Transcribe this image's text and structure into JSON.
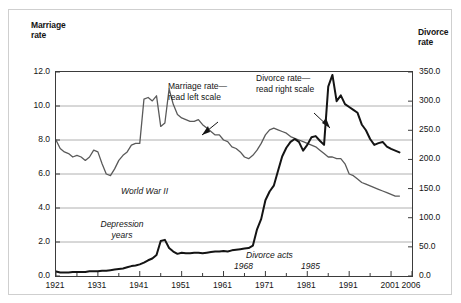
{
  "chart_data": {
    "type": "line",
    "title": "",
    "subtitle": "",
    "xlabel": "",
    "ylabel": "Marriage rate",
    "y2label": "Divorce rate",
    "grid": true,
    "legend_position": "inline-annotations",
    "xlim": [
      1921,
      2006
    ],
    "ylim": [
      0.0,
      12.0
    ],
    "y2lim": [
      0.0,
      350.0
    ],
    "x_ticks": [
      "1921",
      "1931",
      "1941",
      "1951",
      "1961",
      "1971",
      "1981",
      "1991",
      "2001",
      "2006"
    ],
    "x_tick_values": [
      1921,
      1931,
      1941,
      1951,
      1961,
      1971,
      1981,
      1991,
      2001,
      2006
    ],
    "y_ticks_left": [
      "0.0",
      "2.0",
      "4.0",
      "6.0",
      "8.0",
      "10.0",
      "12.0"
    ],
    "y_tick_values_left": [
      0.0,
      2.0,
      4.0,
      6.0,
      8.0,
      10.0,
      12.0
    ],
    "y_ticks_right": [
      "0.0",
      "50.0",
      "100.0",
      "150.0",
      "200.0",
      "250.0",
      "300.0",
      "350.0"
    ],
    "y_tick_values_right": [
      0.0,
      50.0,
      100.0,
      150.0,
      200.0,
      250.0,
      300.0,
      350.0
    ],
    "series": [
      {
        "name": "Marriage rate",
        "axis": "left",
        "color": "#5a5a5a",
        "x": [
          1921,
          1922,
          1923,
          1924,
          1925,
          1926,
          1927,
          1928,
          1929,
          1930,
          1931,
          1932,
          1933,
          1934,
          1935,
          1936,
          1937,
          1938,
          1939,
          1940,
          1941,
          1942,
          1943,
          1944,
          1945,
          1946,
          1947,
          1948,
          1949,
          1950,
          1951,
          1952,
          1953,
          1954,
          1955,
          1956,
          1957,
          1958,
          1959,
          1960,
          1961,
          1962,
          1963,
          1964,
          1965,
          1966,
          1967,
          1968,
          1969,
          1970,
          1971,
          1972,
          1973,
          1974,
          1975,
          1976,
          1977,
          1978,
          1979,
          1980,
          1981,
          1982,
          1983,
          1984,
          1985,
          1986,
          1987,
          1988,
          1989,
          1990,
          1991,
          1992,
          1993,
          1994,
          1995,
          1996,
          1997,
          1998,
          1999,
          2000,
          2001,
          2002,
          2003
        ],
        "values": [
          8.0,
          7.5,
          7.3,
          7.2,
          7.0,
          7.1,
          7.0,
          6.8,
          7.0,
          7.4,
          7.3,
          6.6,
          6.0,
          5.9,
          6.3,
          6.8,
          7.1,
          7.3,
          7.7,
          7.8,
          7.8,
          10.4,
          10.5,
          10.3,
          10.6,
          8.8,
          9.0,
          11.0,
          10.1,
          9.5,
          9.3,
          9.2,
          9.1,
          9.1,
          9.2,
          8.9,
          8.7,
          8.5,
          8.3,
          8.3,
          8.0,
          7.9,
          7.6,
          7.5,
          7.3,
          7.0,
          6.9,
          7.1,
          7.4,
          7.8,
          8.3,
          8.6,
          8.7,
          8.6,
          8.5,
          8.4,
          8.2,
          8.1,
          8.0,
          7.9,
          7.8,
          7.7,
          7.6,
          7.4,
          7.2,
          7.0,
          7.0,
          6.9,
          6.9,
          6.6,
          6.0,
          5.9,
          5.7,
          5.5,
          5.4,
          5.3,
          5.2,
          5.1,
          5.0,
          4.9,
          4.8,
          4.7,
          4.7
        ]
      },
      {
        "name": "Divorce rate",
        "axis": "right",
        "color": "#141414",
        "x": [
          1921,
          1922,
          1923,
          1924,
          1925,
          1926,
          1927,
          1928,
          1929,
          1930,
          1931,
          1932,
          1933,
          1934,
          1935,
          1936,
          1937,
          1938,
          1939,
          1940,
          1941,
          1942,
          1943,
          1944,
          1945,
          1946,
          1947,
          1948,
          1949,
          1950,
          1951,
          1952,
          1953,
          1954,
          1955,
          1956,
          1957,
          1958,
          1959,
          1960,
          1961,
          1962,
          1963,
          1964,
          1965,
          1966,
          1967,
          1968,
          1969,
          1970,
          1971,
          1972,
          1973,
          1974,
          1975,
          1976,
          1977,
          1978,
          1979,
          1980,
          1981,
          1982,
          1983,
          1984,
          1985,
          1986,
          1987,
          1988,
          1989,
          1990,
          1991,
          1992,
          1993,
          1994,
          1995,
          1996,
          1997,
          1998,
          1999,
          2000,
          2001,
          2002,
          2003
        ],
        "values": [
          8,
          6,
          6,
          6,
          7,
          7,
          7,
          7,
          8,
          8,
          8,
          9,
          9,
          10,
          11,
          12,
          13,
          15,
          17,
          18,
          20,
          23,
          27,
          30,
          36,
          60,
          62,
          48,
          42,
          38,
          40,
          39,
          39,
          40,
          40,
          39,
          40,
          41,
          42,
          42,
          43,
          42,
          44,
          45,
          46,
          47,
          48,
          52,
          80,
          98,
          130,
          145,
          155,
          180,
          205,
          220,
          230,
          235,
          230,
          215,
          225,
          238,
          240,
          232,
          225,
          325,
          345,
          300,
          310,
          295,
          290,
          285,
          280,
          260,
          250,
          235,
          225,
          228,
          230,
          222,
          218,
          215,
          212
        ]
      }
    ],
    "annotations": [
      {
        "id": "world-war-2",
        "text": "World War II"
      },
      {
        "id": "depression-years",
        "text": "Depression\nyears"
      },
      {
        "id": "divorce-acts",
        "text": "Divorce acts"
      },
      {
        "id": "divorce-act-year-1968",
        "text": "1968"
      },
      {
        "id": "divorce-act-year-1985",
        "text": "1985"
      },
      {
        "id": "marriage-callout",
        "text": "Marriage rate—\nread left scale"
      },
      {
        "id": "divorce-callout",
        "text": "Divorce rate—\nread right scale"
      }
    ]
  },
  "left_axis": {
    "title_line1": "Marriage",
    "title_line2": "rate",
    "ticks": [
      "12.0",
      "10.0",
      "8.0",
      "6.0",
      "4.0",
      "2.0",
      "0.0"
    ]
  },
  "right_axis": {
    "title_line1": "Divorce",
    "title_line2": "rate",
    "ticks": [
      "350.0",
      "300.0",
      "250.0",
      "200.0",
      "150.0",
      "100.0",
      "50.0",
      "0.0"
    ]
  },
  "x_axis": {
    "ticks": [
      "1921",
      "1931",
      "1941",
      "1951",
      "1961",
      "1971",
      "1981",
      "1991",
      "2001",
      "2006"
    ]
  },
  "callouts": {
    "marriage_line1": "Marriage rate—",
    "marriage_line2": "read left scale",
    "divorce_line1": "Divorce rate—",
    "divorce_line2": "read right scale"
  },
  "annotations": {
    "world_war_2": "World War II",
    "depression_line1": "Depression",
    "depression_line2": "years",
    "divorce_acts": "Divorce acts",
    "year_1968": "1968",
    "year_1985": "1985"
  },
  "colors": {
    "marriage_line": "#5a5a5a",
    "divorce_line": "#141414",
    "gridline": "#b0b0b0",
    "frame": "#3b3b3b",
    "outer_border": "#cfcfcf",
    "text": "#141414"
  }
}
